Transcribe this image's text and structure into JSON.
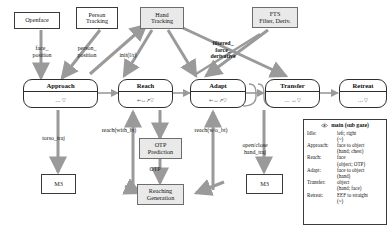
{
  "diagram": {
    "colors": {
      "arrow_gray": "#9a9a9a",
      "node_stroke": "#2e2e2e",
      "shaded_fill": "#e9e9e9",
      "text": "#141414"
    }
  },
  "sources": [
    {
      "id": "openface",
      "label": "Openface",
      "shaded": false
    },
    {
      "id": "person-tracking",
      "label": "Person\nTracking",
      "shaded": false
    },
    {
      "id": "hand-tracking",
      "label": "Hand\nTracking",
      "shaded": true
    },
    {
      "id": "fts",
      "label": "FTS\nFilter, Deriv.",
      "shaded": true
    }
  ],
  "states": [
    {
      "id": "approach",
      "label": "Approach",
      "glyphs": "…  ▽"
    },
    {
      "id": "reach",
      "label": "Reach",
      "glyphs": "⇐↔↗▽"
    },
    {
      "id": "adapt",
      "label": "Adapt",
      "glyphs": "⇐↔↗▽"
    },
    {
      "id": "transfer",
      "label": "Transfer",
      "glyphs": "…  ↔▽"
    },
    {
      "id": "retreat",
      "label": "Retreat",
      "glyphs": "…  ▽"
    }
  ],
  "processes": [
    {
      "id": "otp-prediction",
      "label": "OTP\nPrediction",
      "shaded": true
    },
    {
      "id": "reaching-generation",
      "label": "Reaching\nGeneration",
      "shaded": true
    }
  ],
  "sinks": [
    {
      "id": "m3-torso",
      "label": "M3"
    },
    {
      "id": "m3-hand",
      "label": "M3"
    }
  ],
  "edge_labels": [
    {
      "id": "face-position",
      "text": "face_\nposition"
    },
    {
      "id": "person-position",
      "text": "person_\nposition"
    },
    {
      "id": "init-lr",
      "text": "init(l/r)"
    },
    {
      "id": "filtered-force-deriv",
      "text": "filtered_\nforce_\nderivative"
    },
    {
      "id": "torso-traj",
      "text": "torso_traj"
    },
    {
      "id": "reach-with-bt",
      "text": "reach(with_bt)"
    },
    {
      "id": "reach-wo-bt",
      "text": "reach(w/o_bt)"
    },
    {
      "id": "otp",
      "text": "OTP"
    },
    {
      "id": "open-close-hand-traj",
      "text": "open/close\nhand_traj"
    }
  ],
  "legend": {
    "header": "main (sub gaze)",
    "icon": "eye-icon",
    "rows": [
      {
        "key": "Idle:",
        "value": "left; right\n(~)"
      },
      {
        "key": "Approach:",
        "value": "face to object\n(hand; chest)"
      },
      {
        "key": "Reach:",
        "value": "face\n(object; OTP)"
      },
      {
        "key": "Adapt:",
        "value": "face to object\n(hand)"
      },
      {
        "key": "Transfer:",
        "value": "object\n(hand; face)"
      },
      {
        "key": "Retreat:",
        "value": "EEF to straight\n(~)"
      }
    ]
  }
}
